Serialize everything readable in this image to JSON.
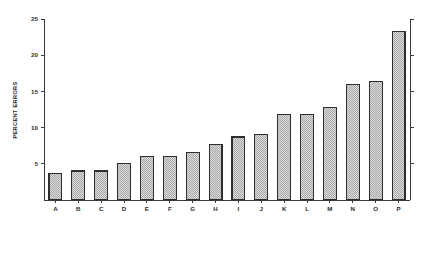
{
  "chart_data": {
    "type": "bar",
    "title": "",
    "subtitle": "",
    "xlabel": "",
    "ylabel": "PERCENT ERRORS",
    "categories": [
      "A",
      "B",
      "C",
      "D",
      "E",
      "F",
      "G",
      "H",
      "I",
      "J",
      "K",
      "L",
      "M",
      "N",
      "O",
      "P"
    ],
    "values": [
      3.6,
      4.0,
      4.0,
      5.1,
      6.0,
      6.0,
      6.6,
      7.7,
      8.7,
      9.0,
      11.8,
      11.8,
      12.8,
      15.9,
      16.4,
      23.3
    ],
    "ylim": [
      0,
      25
    ],
    "xlim_note": "categorical",
    "y_ticks": [
      5,
      10,
      15,
      20,
      25
    ],
    "y_tick_labels": [
      "5",
      "10",
      "15",
      "20",
      "25"
    ],
    "grid": false,
    "legend": null,
    "legend_position": "none",
    "annotations": [],
    "axes": {
      "left_axis_visible": true,
      "right_axis_visible": true,
      "right_axis_labeled": false,
      "bottom_axis_visible": true,
      "top_axis_visible": false
    },
    "style": {
      "bar_fill": "#d4d4d4",
      "bar_edge": "#2e2e2e",
      "bar_pattern": "checkered-halftone",
      "background": "#ffffff",
      "axis_color": "#3a3a3a",
      "text_color": "#2b2b2b"
    }
  }
}
